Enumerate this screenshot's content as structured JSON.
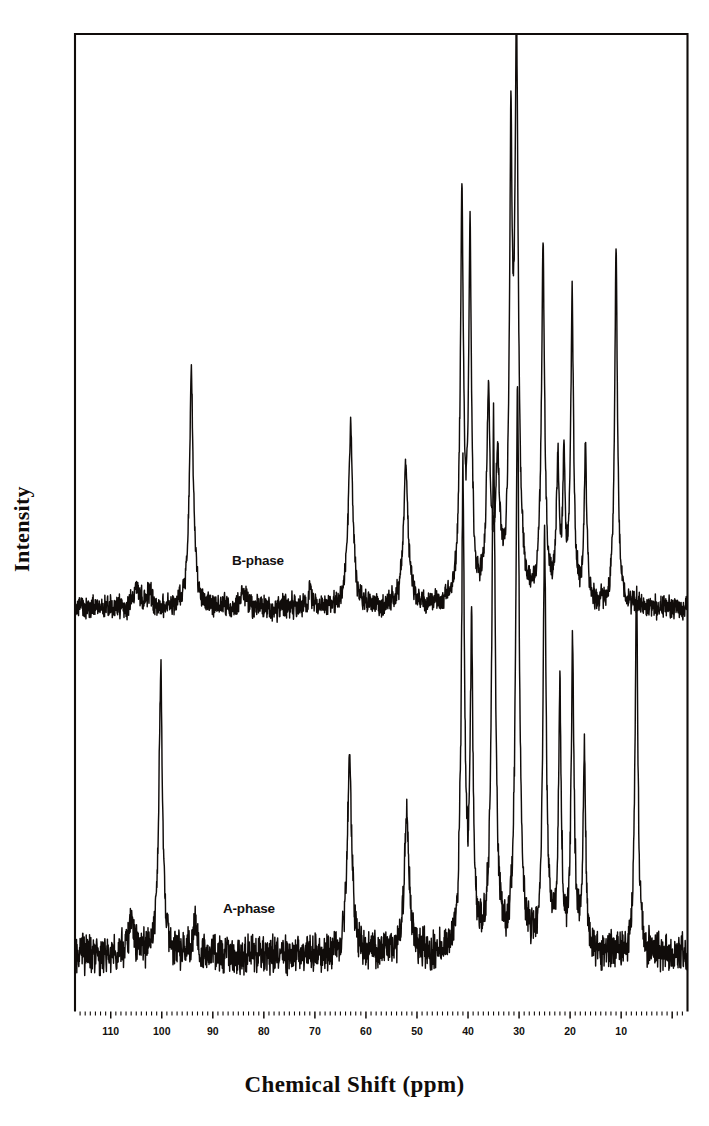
{
  "figure": {
    "kind": "nmr-spectrum",
    "xaxis_title": "Chemical Shift (ppm)",
    "yaxis_title": "Intensity",
    "frame_color": "#100c0a",
    "trace_color": "#100c0a",
    "background": "#ffffff"
  },
  "traces": [
    {
      "id": "b-phase",
      "label": "B-phase"
    },
    {
      "id": "a-phase",
      "label": "A-phase"
    }
  ],
  "chart_data": {
    "type": "line",
    "title": "",
    "xlabel": "Chemical Shift (ppm)",
    "ylabel": "Intensity",
    "xlim": [
      117,
      -3
    ],
    "x_inverted": true,
    "grid": false,
    "legend_position": "inline-annotation",
    "tick_labels": [
      110,
      100,
      90,
      80,
      70,
      60,
      50,
      40,
      30,
      20,
      10
    ],
    "major_tick_step": 10,
    "minor_tick_step": 1,
    "yticks": [],
    "annotations": [
      {
        "text": "B-phase",
        "x_ppm": 78,
        "trace": "b-phase"
      },
      {
        "text": "A-phase",
        "x_ppm": 80,
        "trace": "a-phase"
      }
    ],
    "series": [
      {
        "name": "B-phase",
        "baseline_noise_amplitude": 0.035,
        "peaks": [
          {
            "ppm": 105.0,
            "height": 0.07,
            "width": 1.6
          },
          {
            "ppm": 102.5,
            "height": 0.05,
            "width": 1.2
          },
          {
            "ppm": 94.2,
            "height": 0.72,
            "width": 1.1
          },
          {
            "ppm": 84.0,
            "height": 0.05,
            "width": 1.4
          },
          {
            "ppm": 71.0,
            "height": 0.06,
            "width": 1.0
          },
          {
            "ppm": 63.0,
            "height": 0.55,
            "width": 1.2
          },
          {
            "ppm": 52.2,
            "height": 0.44,
            "width": 1.3
          },
          {
            "ppm": 41.2,
            "height": 1.22,
            "width": 0.9
          },
          {
            "ppm": 39.6,
            "height": 1.12,
            "width": 0.8
          },
          {
            "ppm": 36.0,
            "height": 0.62,
            "width": 1.0
          },
          {
            "ppm": 34.2,
            "height": 0.42,
            "width": 1.1
          },
          {
            "ppm": 30.5,
            "height": 1.7,
            "width": 1.0
          },
          {
            "ppm": 31.6,
            "height": 1.3,
            "width": 0.8
          },
          {
            "ppm": 25.3,
            "height": 1.1,
            "width": 0.9
          },
          {
            "ppm": 22.4,
            "height": 0.42,
            "width": 0.8
          },
          {
            "ppm": 21.2,
            "height": 0.4,
            "width": 0.7
          },
          {
            "ppm": 19.6,
            "height": 0.95,
            "width": 0.8
          },
          {
            "ppm": 17.0,
            "height": 0.5,
            "width": 0.7
          },
          {
            "ppm": 11.0,
            "height": 1.1,
            "width": 0.8
          }
        ]
      },
      {
        "name": "A-phase",
        "baseline_noise_amplitude": 0.05,
        "peaks": [
          {
            "ppm": 106.0,
            "height": 0.09,
            "width": 1.6
          },
          {
            "ppm": 100.2,
            "height": 0.8,
            "width": 1.0
          },
          {
            "ppm": 93.5,
            "height": 0.09,
            "width": 1.3
          },
          {
            "ppm": 63.2,
            "height": 0.56,
            "width": 1.2
          },
          {
            "ppm": 52.0,
            "height": 0.4,
            "width": 1.3
          },
          {
            "ppm": 41.0,
            "height": 1.3,
            "width": 0.9
          },
          {
            "ppm": 39.3,
            "height": 0.85,
            "width": 0.8
          },
          {
            "ppm": 35.0,
            "height": 1.45,
            "width": 1.0
          },
          {
            "ppm": 30.3,
            "height": 1.55,
            "width": 1.0
          },
          {
            "ppm": 25.0,
            "height": 1.15,
            "width": 0.9
          },
          {
            "ppm": 22.0,
            "height": 0.7,
            "width": 0.8
          },
          {
            "ppm": 19.5,
            "height": 0.85,
            "width": 0.8
          },
          {
            "ppm": 17.2,
            "height": 0.55,
            "width": 0.7
          },
          {
            "ppm": 7.0,
            "height": 1.05,
            "width": 0.8
          }
        ]
      }
    ]
  }
}
